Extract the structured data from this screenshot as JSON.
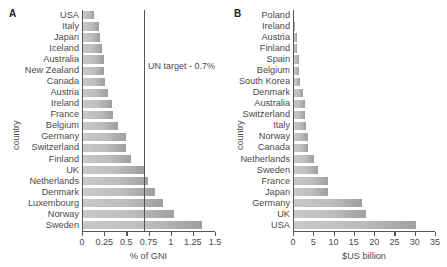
{
  "figure": {
    "panels": [
      {
        "letter": "A",
        "ylabel": "country",
        "xlabel": "% of GNI",
        "annotation": "UN target - 0.7%",
        "annotation_value": 0.7
      },
      {
        "letter": "B",
        "ylabel": "country",
        "xlabel": "$US billion"
      }
    ]
  },
  "chart_data": [
    {
      "type": "bar",
      "orientation": "horizontal",
      "title": "",
      "panel": "A",
      "xlabel": "% of GNI",
      "ylabel": "country",
      "xlim": [
        0,
        1.5
      ],
      "xticks": [
        0,
        0.25,
        0.5,
        0.75,
        1,
        1.25,
        1.5
      ],
      "xticklabels": [
        "0",
        "0.25",
        "0.5",
        "0.75",
        "1",
        "1.25",
        "1.5"
      ],
      "grid": false,
      "legend": "none",
      "annotations": [
        {
          "text": "UN target - 0.7%",
          "type": "vline",
          "x": 0.7
        }
      ],
      "categories": [
        "USA",
        "Italy",
        "Japan",
        "Iceland",
        "Australia",
        "New Zealand",
        "Canada",
        "Austria",
        "Ireland",
        "France",
        "Belgium",
        "Germany",
        "Switzerland",
        "Finland",
        "UK",
        "Netherlands",
        "Denmark",
        "Luxembourg",
        "Norway",
        "Sweden"
      ],
      "values": [
        0.14,
        0.19,
        0.2,
        0.22,
        0.25,
        0.25,
        0.26,
        0.29,
        0.34,
        0.35,
        0.41,
        0.5,
        0.5,
        0.55,
        0.7,
        0.74,
        0.82,
        0.91,
        1.04,
        1.35
      ]
    },
    {
      "type": "bar",
      "orientation": "horizontal",
      "title": "",
      "panel": "B",
      "xlabel": "$US billion",
      "ylabel": "country",
      "xlim": [
        0,
        35
      ],
      "xticks": [
        0,
        5,
        10,
        15,
        20,
        25,
        30,
        35
      ],
      "xticklabels": [
        "0",
        "5",
        "10",
        "15",
        "20",
        "25",
        "30",
        "35"
      ],
      "grid": false,
      "legend": "none",
      "categories": [
        "Poland",
        "Ireland",
        "Austria",
        "Finland",
        "Spain",
        "Belgium",
        "South Korea",
        "Denmark",
        "Australia",
        "Switzerland",
        "Italy",
        "Norway",
        "Canada",
        "Netherlands",
        "Sweden",
        "France",
        "Japan",
        "Germany",
        "UK",
        "USA"
      ],
      "values": [
        0.3,
        0.6,
        1.0,
        1.1,
        1.5,
        1.6,
        1.7,
        2.4,
        2.9,
        3.0,
        3.3,
        3.6,
        3.7,
        5.1,
        6.2,
        8.6,
        8.7,
        17.0,
        18.1,
        30.4
      ]
    }
  ],
  "colors": {
    "bar_light": "#c9c9c9",
    "bar_dark": "#9e9e9e",
    "axis": "#555555",
    "text": "#4a4a4a"
  }
}
